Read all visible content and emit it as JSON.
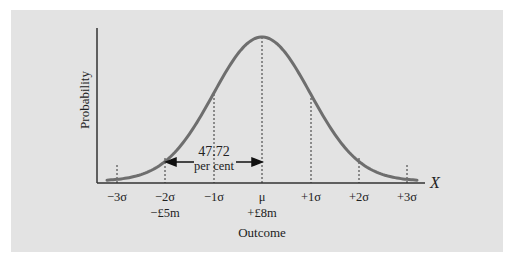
{
  "chart_data": {
    "type": "line",
    "title": "",
    "xlabel": "Outcome",
    "ylabel": "Probability",
    "x_axis_variable": "X",
    "distribution": "normal",
    "x_ticks": [
      {
        "label": "−3σ",
        "sub": "",
        "sigma": -3
      },
      {
        "label": "−2σ",
        "sub": "−£5m",
        "sigma": -2
      },
      {
        "label": "−1σ",
        "sub": "",
        "sigma": -1
      },
      {
        "label": "μ",
        "sub": "+£8m",
        "sigma": 0
      },
      {
        "label": "+1σ",
        "sub": "",
        "sigma": 1
      },
      {
        "label": "+2σ",
        "sub": "",
        "sigma": 2
      },
      {
        "label": "+3σ",
        "sub": "",
        "sigma": 3
      }
    ],
    "annotation": {
      "value": "47.72",
      "unit": "per cent",
      "from_sigma": -2,
      "to_sigma": 0
    },
    "grid": false,
    "legend": null,
    "curve_color": "#6e6e6e",
    "background_color": "#e3e3e3"
  }
}
